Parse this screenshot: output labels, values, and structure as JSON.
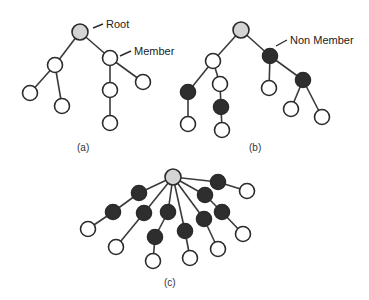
{
  "colors": {
    "root": "#d4d4d4",
    "member": "#ffffff",
    "non_member": "#2e2e2e",
    "edge": "#3a3a3a"
  },
  "annotations": {
    "root": "Root",
    "member": "Member",
    "non_member": "Non Member"
  },
  "captions": {
    "a": "(a)",
    "b": "(b)",
    "c": "(c)"
  },
  "trees": {
    "a": {
      "caption": "(a)",
      "nodes": [
        {
          "id": "a0",
          "type": "root",
          "x": 80,
          "y": 32
        },
        {
          "id": "a1",
          "type": "member",
          "x": 55,
          "y": 65
        },
        {
          "id": "a2",
          "type": "member",
          "x": 110,
          "y": 58
        },
        {
          "id": "a3",
          "type": "member",
          "x": 30,
          "y": 93
        },
        {
          "id": "a4",
          "type": "member",
          "x": 62,
          "y": 106
        },
        {
          "id": "a5",
          "type": "member",
          "x": 110,
          "y": 90
        },
        {
          "id": "a6",
          "type": "member",
          "x": 143,
          "y": 82
        },
        {
          "id": "a7",
          "type": "member",
          "x": 110,
          "y": 123
        }
      ],
      "edges": [
        [
          "a0",
          "a1"
        ],
        [
          "a0",
          "a2"
        ],
        [
          "a1",
          "a3"
        ],
        [
          "a1",
          "a4"
        ],
        [
          "a2",
          "a5"
        ],
        [
          "a2",
          "a6"
        ],
        [
          "a5",
          "a7"
        ]
      ]
    },
    "b": {
      "caption": "(b)",
      "nodes": [
        {
          "id": "b0",
          "type": "root",
          "x": 241,
          "y": 30
        },
        {
          "id": "b1",
          "type": "member",
          "x": 213,
          "y": 61
        },
        {
          "id": "b2",
          "type": "non_member",
          "x": 270,
          "y": 56
        },
        {
          "id": "b3",
          "type": "non_member",
          "x": 188,
          "y": 92
        },
        {
          "id": "b4",
          "type": "member",
          "x": 220,
          "y": 84
        },
        {
          "id": "b5",
          "type": "non_member",
          "x": 221,
          "y": 107
        },
        {
          "id": "b6",
          "type": "member",
          "x": 188,
          "y": 124
        },
        {
          "id": "b7",
          "type": "member",
          "x": 222,
          "y": 130
        },
        {
          "id": "b8",
          "type": "member",
          "x": 269,
          "y": 88
        },
        {
          "id": "b9",
          "type": "non_member",
          "x": 303,
          "y": 80
        },
        {
          "id": "b10",
          "type": "member",
          "x": 291,
          "y": 109
        },
        {
          "id": "b11",
          "type": "member",
          "x": 322,
          "y": 117
        }
      ],
      "edges": [
        [
          "b0",
          "b1"
        ],
        [
          "b0",
          "b2"
        ],
        [
          "b1",
          "b3"
        ],
        [
          "b1",
          "b4"
        ],
        [
          "b4",
          "b5"
        ],
        [
          "b3",
          "b6"
        ],
        [
          "b5",
          "b7"
        ],
        [
          "b2",
          "b8"
        ],
        [
          "b2",
          "b9"
        ],
        [
          "b9",
          "b10"
        ],
        [
          "b9",
          "b11"
        ]
      ]
    },
    "c": {
      "caption": "(c)",
      "nodes": [
        {
          "id": "c0",
          "type": "root",
          "x": 173,
          "y": 177
        },
        {
          "id": "c1",
          "type": "non_member",
          "x": 218,
          "y": 182
        },
        {
          "id": "c2",
          "type": "member",
          "x": 247,
          "y": 191
        },
        {
          "id": "c3",
          "type": "non_member",
          "x": 205,
          "y": 195
        },
        {
          "id": "c4",
          "type": "non_member",
          "x": 222,
          "y": 212
        },
        {
          "id": "c5",
          "type": "member",
          "x": 243,
          "y": 234
        },
        {
          "id": "c6",
          "type": "non_member",
          "x": 139,
          "y": 193
        },
        {
          "id": "c7",
          "type": "non_member",
          "x": 113,
          "y": 212
        },
        {
          "id": "c8",
          "type": "member",
          "x": 88,
          "y": 229
        },
        {
          "id": "c9",
          "type": "non_member",
          "x": 144,
          "y": 213
        },
        {
          "id": "c10",
          "type": "member",
          "x": 116,
          "y": 247
        },
        {
          "id": "c11",
          "type": "non_member",
          "x": 168,
          "y": 212
        },
        {
          "id": "c12",
          "type": "non_member",
          "x": 155,
          "y": 237
        },
        {
          "id": "c13",
          "type": "member",
          "x": 153,
          "y": 261
        },
        {
          "id": "c14",
          "type": "non_member",
          "x": 185,
          "y": 231
        },
        {
          "id": "c15",
          "type": "member",
          "x": 190,
          "y": 258
        },
        {
          "id": "c16",
          "type": "non_member",
          "x": 204,
          "y": 219
        },
        {
          "id": "c17",
          "type": "member",
          "x": 218,
          "y": 249
        }
      ],
      "edges": [
        [
          "c0",
          "c1"
        ],
        [
          "c1",
          "c2"
        ],
        [
          "c0",
          "c3"
        ],
        [
          "c3",
          "c4"
        ],
        [
          "c4",
          "c5"
        ],
        [
          "c0",
          "c6"
        ],
        [
          "c6",
          "c7"
        ],
        [
          "c7",
          "c8"
        ],
        [
          "c0",
          "c9"
        ],
        [
          "c9",
          "c10"
        ],
        [
          "c0",
          "c11"
        ],
        [
          "c11",
          "c12"
        ],
        [
          "c12",
          "c13"
        ],
        [
          "c0",
          "c14"
        ],
        [
          "c14",
          "c15"
        ],
        [
          "c0",
          "c16"
        ],
        [
          "c16",
          "c17"
        ]
      ]
    }
  }
}
